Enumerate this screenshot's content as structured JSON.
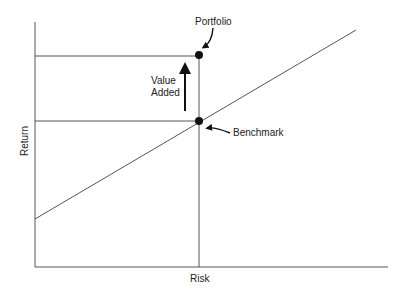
{
  "diagram": {
    "x_axis_label": "Risk",
    "y_axis_label": "Return",
    "portfolio_label": "Portfolio",
    "benchmark_label": "Benchmark",
    "value_added_line1": "Value",
    "value_added_line2": "Added",
    "colors": {
      "line": "#555555",
      "point": "#111111",
      "text": "#222222"
    }
  }
}
